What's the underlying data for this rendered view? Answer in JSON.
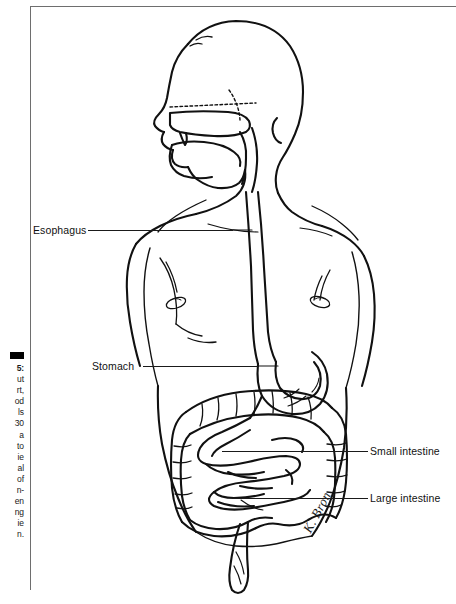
{
  "figure": {
    "alt": "Line drawing of a human torso in profile showing the esophagus, stomach, small intestine and large intestine",
    "style": "black-and-white line art",
    "signature": "K. Bron"
  },
  "frame": {
    "rule_color": "#6e6e6e",
    "ink_color": "#111111"
  },
  "caption": {
    "marker": "black-square",
    "number": "5:",
    "lines": [
      "ut",
      "rt,",
      "od",
      "ls",
      "30",
      "a",
      "to",
      "ie",
      "al",
      "of",
      "n-",
      "en",
      "ng",
      "ie",
      "n."
    ]
  },
  "labels": {
    "esophagus": "Esophagus",
    "stomach": "Stomach",
    "small_intestine": "Small intestine",
    "large_intestine": "Large intestine"
  }
}
